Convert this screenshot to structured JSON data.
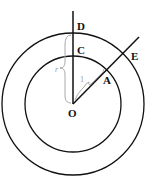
{
  "diagram": {
    "type": "concentric-circles",
    "points": {
      "O": "O",
      "A": "A",
      "C": "C",
      "D": "D",
      "E": "E"
    },
    "annotations": {
      "inner_radius": "1",
      "outer_radius": "r"
    },
    "stroke_color": "#111111",
    "brace_color": "#aaaaaa"
  }
}
